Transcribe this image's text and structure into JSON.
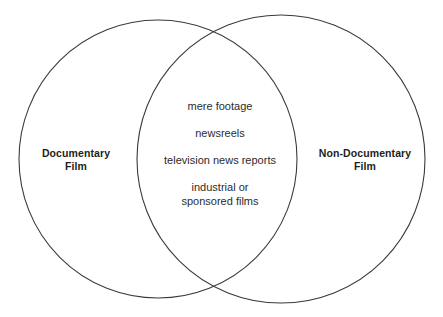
{
  "figure": {
    "type": "venn-diagram",
    "background_color": "#ffffff",
    "stroke_color": "#3a3a3a",
    "fill_color": "#ffffff",
    "text_color": "#2c2c2c",
    "label_color": "#231f20"
  },
  "left_set": {
    "label_line1": "Documentary",
    "label_line2": "Film",
    "circle": {
      "cx": 158,
      "cy": 159,
      "r": 139
    }
  },
  "right_set": {
    "label_line1": "Non-Documentary",
    "label_line2": "Film",
    "circle": {
      "cx": 281,
      "cy": 159,
      "r": 144
    }
  },
  "intersection": {
    "items": [
      "mere footage",
      "newsreels",
      "television news reports"
    ],
    "last_item_line1": "industrial or",
    "last_item_line2": "sponsored films"
  }
}
